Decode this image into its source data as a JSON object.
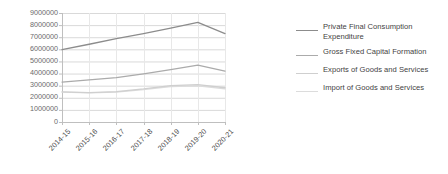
{
  "chart_data": {
    "type": "line",
    "title": "",
    "xlabel": "",
    "ylabel": "",
    "categories": [
      "2014-15",
      "2015-16",
      "2016-17",
      "2017-18",
      "2018-19",
      "2019-20",
      "2020-21"
    ],
    "ylim": [
      0,
      9000000
    ],
    "ytick_values": [
      0,
      1000000,
      2000000,
      3000000,
      4000000,
      5000000,
      6000000,
      7000000,
      8000000,
      9000000
    ],
    "ytick_labels": [
      "0",
      "1000000",
      "2000000",
      "3000000",
      "4000000",
      "5000000",
      "6000000",
      "7000000",
      "8000000",
      "9000000"
    ],
    "grid": true,
    "legend_position": "right",
    "series": [
      {
        "name": "Private Final Consumption Expenditure",
        "color": "#8c8c8c",
        "values": [
          5980000,
          6420000,
          6880000,
          7300000,
          7760000,
          8230000,
          7300000
        ]
      },
      {
        "name": "Gross Fixed Capital Formation",
        "color": "#ababab",
        "values": [
          3300000,
          3470000,
          3660000,
          3980000,
          4330000,
          4700000,
          4200000
        ]
      },
      {
        "name": "Exports of Goods and Services",
        "color": "#cfcfcf",
        "values": [
          2490000,
          2420000,
          2510000,
          2730000,
          3000000,
          3090000,
          2830000
        ]
      },
      {
        "name": "Import of Goods and Services",
        "color": "#dcdcdc",
        "values": [
          2470000,
          2400000,
          2470000,
          2670000,
          2930000,
          2990000,
          2740000
        ]
      }
    ]
  },
  "legend": {
    "items": [
      {
        "label": "Private Final Consumption\nExpenditure",
        "color": "#8c8c8c"
      },
      {
        "label": "Gross Fixed Capital Formation",
        "color": "#ababab"
      },
      {
        "label": "Exports of Goods and Services",
        "color": "#cfcfcf"
      },
      {
        "label": "Import of Goods and Services",
        "color": "#dcdcdc"
      }
    ]
  },
  "plot_area": {
    "left": 62,
    "right": 225,
    "top": 13,
    "bottom": 122
  },
  "colors": {
    "grid": "#d9d9d9",
    "axis": "#bfbfbf",
    "tick_text": "#6b6b6b"
  }
}
